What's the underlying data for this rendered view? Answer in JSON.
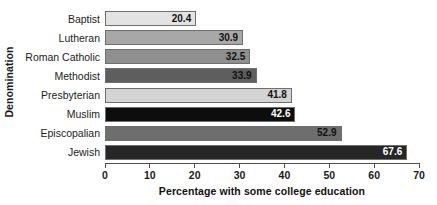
{
  "chart_data": {
    "type": "bar",
    "orientation": "horizontal",
    "title": "",
    "xlabel": "Percentage with some college education",
    "ylabel": "Denomination",
    "xlim": [
      0,
      70
    ],
    "xticks": [
      0,
      10,
      20,
      30,
      40,
      50,
      60,
      70
    ],
    "xtick_labels": [
      "0",
      "10",
      "20",
      "30",
      "40",
      "50",
      "60",
      "70"
    ],
    "grid": false,
    "legend": false,
    "categories": [
      "Baptist",
      "Lutheran",
      "Roman Catholic",
      "Methodist",
      "Presbyterian",
      "Muslim",
      "Episcopalian",
      "Jewish"
    ],
    "values": [
      20.4,
      30.9,
      32.5,
      33.9,
      41.8,
      42.6,
      52.9,
      67.6
    ],
    "value_labels": [
      "20.4",
      "30.9",
      "32.5",
      "33.9",
      "41.8",
      "42.6",
      "52.9",
      "67.6"
    ],
    "bar_colors": [
      "#e3e3e3",
      "#a8a8a8",
      "#8f8f8f",
      "#5e5e5e",
      "#d4d4d4",
      "#0d0d0d",
      "#6e6e6e",
      "#262626"
    ],
    "value_label_colors": [
      "#111111",
      "#111111",
      "#111111",
      "#111111",
      "#111111",
      "#ffffff",
      "#111111",
      "#ffffff"
    ],
    "bar_edge_color": "#6e6e6e",
    "axis_color": "#4d4d4d",
    "background_color": "#ffffff"
  }
}
